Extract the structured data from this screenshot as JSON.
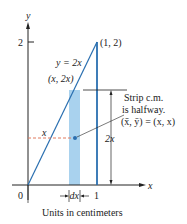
{
  "figure": {
    "axis_labels": {
      "x": "x",
      "y": "y"
    },
    "ticks": {
      "y_tick": "2",
      "x_tick": "1",
      "origin": "0"
    },
    "curve_label": "y = 2x",
    "endpoint_label": "(1, 2)",
    "strip_top_label": "(x, 2x)",
    "dashed_label": "x",
    "height_label": "2x",
    "width_label": "dx",
    "annotation": {
      "line1": "Strip c.m.",
      "line2": "is halfway.",
      "line3": "(x̄, ȳ) = (x, x)"
    },
    "caption": "Units in centimeters",
    "colors": {
      "line": "#2a6fb0",
      "strip": "#a9d2ee",
      "dashed": "#e07a5f",
      "axis": "#222222"
    }
  }
}
